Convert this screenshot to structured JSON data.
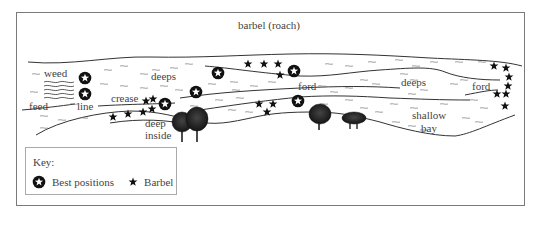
{
  "diagram": {
    "title": "barbel (roach)",
    "labels": {
      "weed": "weed",
      "feed": "feed",
      "line": "line",
      "crease": "crease",
      "deeps_left": "deeps",
      "deep_inside_1": "deep",
      "deep_inside_2": "inside",
      "ford_middle": "ford",
      "deeps_right": "deeps",
      "ford_right": "ford",
      "shallow_bay_1": "shallow",
      "shallow_bay_2": "bay"
    },
    "key": {
      "title": "Key:",
      "items": [
        {
          "icon": "circled-star-icon",
          "label": "Best positions"
        },
        {
          "icon": "star-icon",
          "label": "Barbel"
        }
      ]
    },
    "best_positions": [
      [
        85,
        78
      ],
      [
        85,
        94
      ],
      [
        218,
        73
      ],
      [
        196,
        92
      ],
      [
        165,
        104
      ],
      [
        294,
        71
      ],
      [
        298,
        101
      ]
    ],
    "barbel_positions": [
      [
        248,
        64
      ],
      [
        264,
        64
      ],
      [
        278,
        64
      ],
      [
        280,
        75
      ],
      [
        146,
        101
      ],
      [
        153,
        99
      ],
      [
        152,
        109
      ],
      [
        143,
        112
      ],
      [
        128,
        114
      ],
      [
        113,
        117
      ],
      [
        259,
        104
      ],
      [
        273,
        104
      ],
      [
        267,
        112
      ],
      [
        494,
        66
      ],
      [
        506,
        68
      ],
      [
        509,
        77
      ],
      [
        508,
        86
      ],
      [
        497,
        94
      ],
      [
        506,
        94
      ],
      [
        505,
        106
      ]
    ],
    "colors": {
      "ink": "#1a1a1a",
      "line": "#333333",
      "frame": "#7a7a7a",
      "water_ripple": "#777777"
    }
  }
}
